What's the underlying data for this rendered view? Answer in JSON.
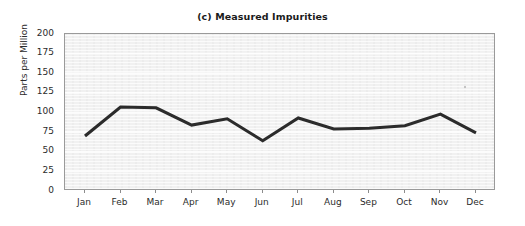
{
  "chart_data": {
    "type": "line",
    "title": "(c) Measured Impurities",
    "xlabel": "",
    "ylabel": "Parts per Million",
    "categories": [
      "Jan",
      "Feb",
      "Mar",
      "Apr",
      "May",
      "Jun",
      "Jul",
      "Aug",
      "Sep",
      "Oct",
      "Nov",
      "Dec"
    ],
    "values": [
      70,
      107,
      106,
      84,
      92,
      64,
      93,
      79,
      80,
      83,
      98,
      74
    ],
    "series": [
      {
        "name": "Measured Impurities",
        "values": [
          70,
          107,
          106,
          84,
          92,
          64,
          93,
          79,
          80,
          83,
          98,
          74
        ]
      }
    ],
    "ylim": [
      0,
      200
    ],
    "ytick_labels": [
      "0",
      "25",
      "50",
      "75",
      "100",
      "125",
      "150",
      "175",
      "200"
    ],
    "ytick_values": [
      0,
      25,
      50,
      75,
      100,
      125,
      150,
      175,
      200
    ],
    "xtick_labels": [
      "Jan",
      "Feb",
      "Mar",
      "Apr",
      "May",
      "Jun",
      "Jul",
      "Aug",
      "Sep",
      "Oct",
      "Nov",
      "Dec"
    ],
    "grid": true,
    "grid_orientation": "horizontal",
    "legend": false,
    "legend_position": "none",
    "line_color": "#2b2b2b",
    "plot_background_color": "#f1f1f1",
    "figure_background_color": "#ffffff",
    "grid_color": "#ffffff",
    "axis_color": "#9a9a9a",
    "text_color": "#2b2b2b"
  }
}
